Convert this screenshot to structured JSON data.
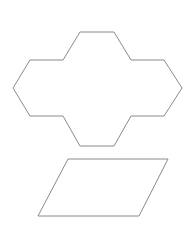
{
  "canvas": {
    "width": 193,
    "height": 232,
    "background": "#ffffff"
  },
  "stroke_color": "#8a8a8a",
  "shapes": [
    {
      "name": "cross-hexagon-shape",
      "type": "polygon",
      "points": "80,32 114,32 131,60 164,60 182,88 164,116 131,116 114,146 80,146 63,116 30,116 13,88 30,60 63,60"
    },
    {
      "name": "parallelogram-shape",
      "type": "polygon",
      "points": "68,159 168,159 139,216 38,216"
    }
  ]
}
